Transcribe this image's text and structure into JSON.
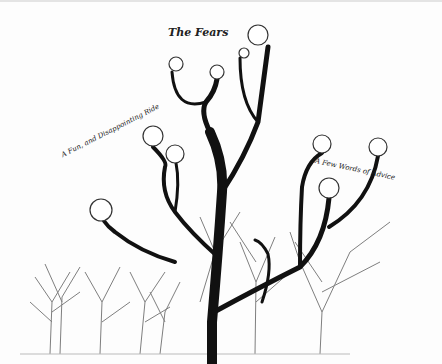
{
  "canvas": {
    "background": "#fdfdfd",
    "branch_color": "#111111"
  },
  "labels": {
    "title": "The Fears",
    "left": "A Fun, and Disappointing Ride",
    "right": "A Few Words of Advice"
  },
  "nodes": [
    {
      "id": "node-1",
      "cx": 258,
      "cy": 33,
      "r": 10
    },
    {
      "id": "node-2",
      "cx": 244,
      "cy": 51,
      "r": 5
    },
    {
      "id": "node-3",
      "cx": 176,
      "cy": 62,
      "r": 7
    },
    {
      "id": "node-4",
      "cx": 217,
      "cy": 70,
      "r": 7
    },
    {
      "id": "node-5",
      "cx": 153,
      "cy": 134,
      "r": 10
    },
    {
      "id": "node-6",
      "cx": 175,
      "cy": 152,
      "r": 9
    },
    {
      "id": "node-7",
      "cx": 101,
      "cy": 208,
      "r": 11
    },
    {
      "id": "node-8",
      "cx": 322,
      "cy": 142,
      "r": 9
    },
    {
      "id": "node-9",
      "cx": 378,
      "cy": 145,
      "r": 9
    },
    {
      "id": "node-10",
      "cx": 329,
      "cy": 186,
      "r": 10
    }
  ]
}
